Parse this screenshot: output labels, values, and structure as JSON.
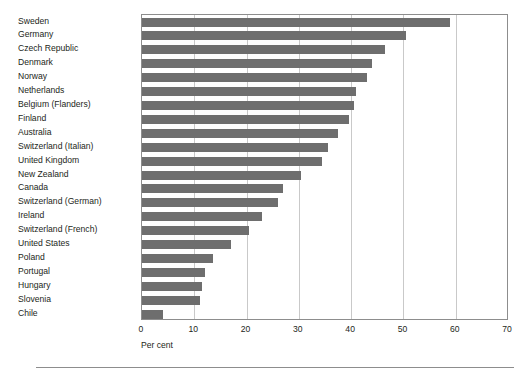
{
  "chart_data": {
    "type": "bar",
    "orientation": "horizontal",
    "title": "",
    "xlabel": "Per cent",
    "ylabel": "",
    "xlim": [
      0,
      70
    ],
    "xticks": [
      0,
      10,
      20,
      30,
      40,
      50,
      60,
      70
    ],
    "grid": true,
    "legend": false,
    "bar_color": "#6e6e6e",
    "frame_color": "#8d8d8d",
    "gridline_color": "#c9c9c9",
    "categories": [
      "Sweden",
      "Germany",
      "Czech Republic",
      "Denmark",
      "Norway",
      "Netherlands",
      "Belgium (Flanders)",
      "Finland",
      "Australia",
      "Switzerland (Italian)",
      "United Kingdom",
      "New Zealand",
      "Canada",
      "Switzerland (German)",
      "Ireland",
      "Switzerland (French)",
      "United States",
      "Poland",
      "Portugal",
      "Hungary",
      "Slovenia",
      "Chile"
    ],
    "values": [
      59.0,
      50.5,
      46.5,
      44.0,
      43.0,
      41.0,
      40.5,
      39.5,
      37.5,
      35.5,
      34.5,
      30.5,
      27.0,
      26.0,
      23.0,
      20.5,
      17.0,
      13.5,
      12.0,
      11.5,
      11.0,
      4.0
    ]
  }
}
